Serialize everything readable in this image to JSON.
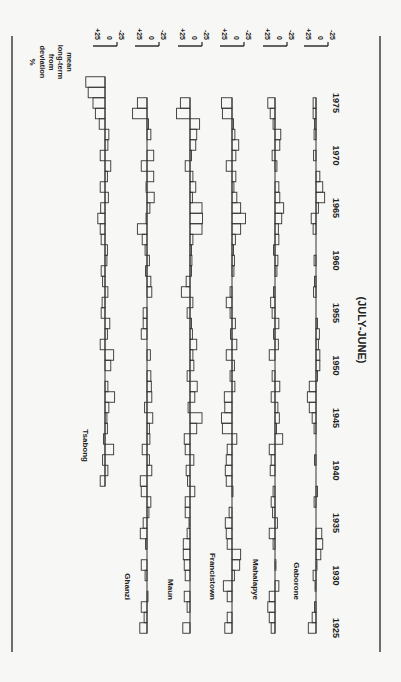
{
  "chart_data": {
    "type": "bar",
    "orientation": "rotated 90 degrees clockwise; years along page vertical axis, deviations horizontal",
    "period_label": "(JULY-JUNE)",
    "ylabel": "% deviation from long-term mean",
    "axis_label_lines": [
      "%",
      "deviation",
      "from",
      "long-term",
      "mean"
    ],
    "tick_labels": [
      "+25",
      "0",
      "-25"
    ],
    "year_ticks": [
      "1925",
      "1930",
      "1935",
      "1940",
      "1945",
      "1950",
      "1955",
      "1960",
      "1965",
      "1970",
      "1975"
    ],
    "xlim": [
      1925,
      1976
    ],
    "series": [
      {
        "name": "Tsabong",
        "start_year": 1939,
        "values": [
          10,
          -6,
          5,
          -18,
          3,
          -5,
          -4,
          -8,
          -20,
          -6,
          0,
          -12,
          -18,
          10,
          -5,
          -10,
          8,
          6,
          -6,
          5,
          8,
          -4,
          -5,
          8,
          10,
          15,
          9,
          -7,
          10,
          -5,
          -12,
          10,
          -6,
          -8,
          12,
          20,
          25,
          35,
          40
        ]
      },
      {
        "name": "Ghanzi",
        "start_year": 1925,
        "values": [
          15,
          6,
          12,
          -2,
          0,
          4,
          12,
          0,
          3,
          14,
          8,
          -4,
          -8,
          12,
          14,
          -10,
          -5,
          10,
          -6,
          -5,
          -12,
          5,
          -10,
          -9,
          -8,
          0,
          -7,
          0,
          12,
          8,
          8,
          0,
          -10,
          -8,
          3,
          -5,
          4,
          10,
          20,
          2,
          -6,
          -15,
          2,
          -14,
          12,
          -14,
          0,
          -8,
          -3,
          30,
          20
        ]
      },
      {
        "name": "Maun",
        "start_year": 1925,
        "values": [
          15,
          0,
          6,
          12,
          0,
          10,
          12,
          14,
          14,
          6,
          2,
          10,
          10,
          -10,
          5,
          8,
          -8,
          10,
          12,
          -14,
          -25,
          4,
          -10,
          -15,
          6,
          -8,
          -6,
          -14,
          -5,
          -3,
          6,
          -6,
          18,
          8,
          -3,
          -4,
          -3,
          -6,
          -25,
          -26,
          -25,
          -5,
          -12,
          -6,
          10,
          -3,
          -12,
          -14,
          -20,
          28,
          20
        ]
      },
      {
        "name": "Francistown",
        "start_year": 1925,
        "values": [
          15,
          10,
          0,
          10,
          18,
          -5,
          -16,
          -18,
          10,
          12,
          14,
          6,
          0,
          -2,
          12,
          14,
          12,
          10,
          -10,
          20,
          22,
          15,
          16,
          -6,
          4,
          -5,
          12,
          -10,
          3,
          -7,
          4,
          12,
          4,
          0,
          -4,
          -5,
          -3,
          -7,
          -18,
          -28,
          -18,
          -10,
          -4,
          -8,
          12,
          -8,
          -14,
          -6,
          -3,
          20,
          22
        ]
      },
      {
        "name": "Mahalapye",
        "start_year": 1925,
        "values": [
          8,
          12,
          15,
          12,
          -8,
          -1,
          -2,
          0,
          4,
          12,
          -5,
          5,
          8,
          4,
          0,
          10,
          8,
          12,
          -16,
          -3,
          -9,
          -6,
          8,
          -10,
          6,
          0,
          12,
          -7,
          3,
          -8,
          6,
          9,
          3,
          0,
          -4,
          -6,
          3,
          -8,
          -7,
          -14,
          -18,
          -10,
          -8,
          0,
          -4,
          6,
          -10,
          -12,
          4,
          10,
          15
        ]
      },
      {
        "name": "Gaborone",
        "start_year": 1925,
        "values": [
          16,
          8,
          3,
          0,
          2,
          6,
          -2,
          -10,
          -14,
          -12,
          0,
          0,
          4,
          -3,
          0,
          0,
          3,
          0,
          0,
          4,
          8,
          14,
          18,
          14,
          -3,
          -8,
          -8,
          -5,
          -7,
          -3,
          0,
          0,
          5,
          3,
          0,
          4,
          0,
          0,
          6,
          10,
          -5,
          -18,
          -14,
          -8,
          0,
          5,
          0,
          4,
          3,
          6,
          6
        ]
      }
    ]
  },
  "figure": {
    "axis_label": {
      "line1": "%",
      "line2": "deviation",
      "line3": "from",
      "line4": "long-term",
      "line5": "mean"
    },
    "period_label": "(JULY-JUNE)",
    "stations": [
      "Tsabong",
      "Ghanzi",
      "Maun",
      "Francistown",
      "Mahalapye",
      "Gaborone"
    ],
    "ticks": {
      "plus": "+25",
      "zero": "0",
      "minus": "-25"
    },
    "years": [
      "1925",
      "1930",
      "1935",
      "1940",
      "1945",
      "1950",
      "1955",
      "1960",
      "1965",
      "1970",
      "1975"
    ]
  }
}
